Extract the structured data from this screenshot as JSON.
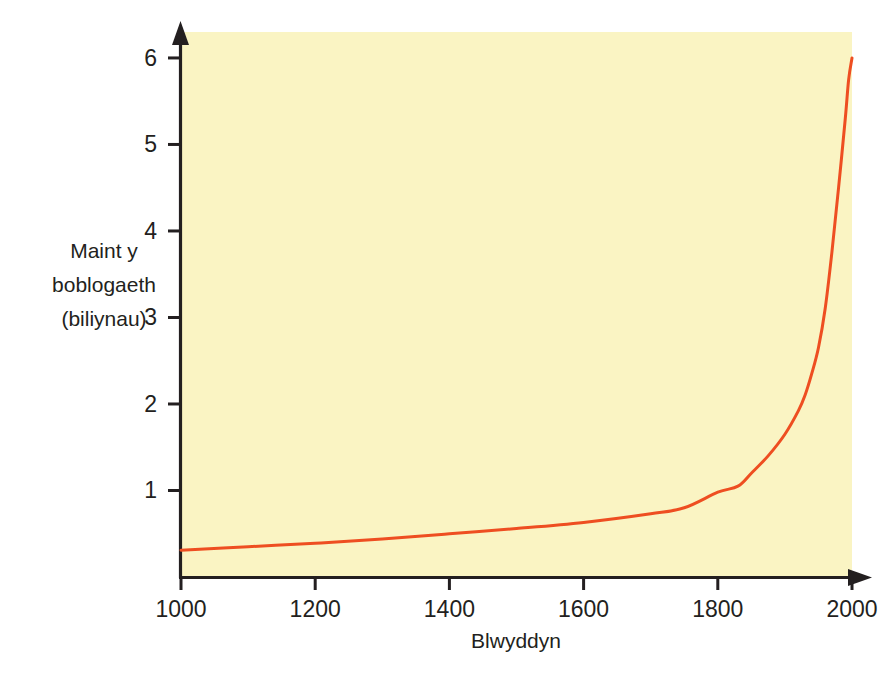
{
  "figure": {
    "background_color": "#ffffff",
    "plot_background_color": "#FAF4C3",
    "axis_color": "#231f20",
    "curve_color": "#EE4E21"
  },
  "chart_data": {
    "type": "line",
    "title": "",
    "subtitle": "",
    "xlabel": "Blwyddyn",
    "ylabel": "Maint y boblogaeth (biliynau)",
    "ylabel_lines": [
      "Maint y",
      "boblogaeth",
      "(biliynau)"
    ],
    "xlim": [
      1000,
      2000
    ],
    "ylim": [
      0,
      6.3
    ],
    "xticks": [
      1000,
      1200,
      1400,
      1600,
      1800,
      2000
    ],
    "xtick_labels": [
      "1000",
      "1200",
      "1400",
      "1600",
      "1800",
      "2000"
    ],
    "yticks": [
      1,
      2,
      3,
      4,
      5,
      6
    ],
    "ytick_labels": [
      "1",
      "2",
      "3",
      "4",
      "5",
      "6"
    ],
    "grid": false,
    "legend": "none",
    "axis_style": "arrow-tipped",
    "series": [
      {
        "name": "Poblogaeth y byd",
        "color": "#EE4E21",
        "line_width": 3,
        "x": [
          1000,
          1100,
          1200,
          1300,
          1400,
          1500,
          1600,
          1700,
          1750,
          1800,
          1830,
          1850,
          1875,
          1900,
          1920,
          1930,
          1940,
          1950,
          1960,
          1970,
          1980,
          1990,
          1995,
          2000
        ],
        "values": [
          0.31,
          0.35,
          0.39,
          0.44,
          0.5,
          0.56,
          0.63,
          0.73,
          0.8,
          0.98,
          1.05,
          1.2,
          1.4,
          1.65,
          1.92,
          2.1,
          2.35,
          2.65,
          3.1,
          3.75,
          4.5,
          5.3,
          5.75,
          6.0
        ]
      }
    ],
    "annotations": []
  },
  "axes": {
    "x_axis_name": "x-axis",
    "y_axis_name": "y-axis"
  }
}
